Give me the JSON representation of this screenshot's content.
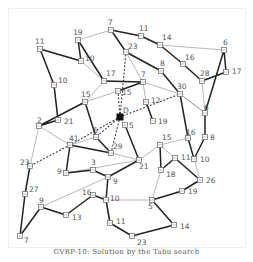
{
  "caption": "GVRP-10: Solution by the Tabu search",
  "depot": {
    "label": "D",
    "x": 120,
    "y": 117
  },
  "nodes": [
    {
      "id": "n1",
      "label": "7",
      "x": 111,
      "y": 30
    },
    {
      "id": "n2",
      "label": "11",
      "x": 141,
      "y": 36
    },
    {
      "id": "n3",
      "label": "14",
      "x": 160,
      "y": 45
    },
    {
      "id": "n4",
      "label": "6",
      "x": 224,
      "y": 50
    },
    {
      "id": "n5",
      "label": "17",
      "x": 226,
      "y": 72
    },
    {
      "id": "n6",
      "label": "19",
      "x": 78,
      "y": 40
    },
    {
      "id": "n7",
      "label": "11",
      "x": 40,
      "y": 49
    },
    {
      "id": "n8",
      "label": "10",
      "x": 81,
      "y": 61
    },
    {
      "id": "n9",
      "label": "23",
      "x": 126,
      "y": 52
    },
    {
      "id": "n10",
      "label": "16",
      "x": 183,
      "y": 64
    },
    {
      "id": "n11",
      "label": "8",
      "x": 161,
      "y": 71
    },
    {
      "id": "n12",
      "label": "28",
      "x": 202,
      "y": 81
    },
    {
      "id": "n13",
      "label": "17",
      "x": 104,
      "y": 81
    },
    {
      "id": "n14",
      "label": "7",
      "x": 143,
      "y": 82
    },
    {
      "id": "n15",
      "label": "10",
      "x": 54,
      "y": 85
    },
    {
      "id": "n16",
      "label": "15",
      "x": 118,
      "y": 91
    },
    {
      "id": "n17",
      "label": "30",
      "x": 180,
      "y": 94
    },
    {
      "id": "n18",
      "label": "15",
      "x": 85,
      "y": 102
    },
    {
      "id": "n19",
      "label": "12",
      "x": 146,
      "y": 102
    },
    {
      "id": "n20",
      "label": "6",
      "x": 205,
      "y": 113
    },
    {
      "id": "n21",
      "label": "5",
      "x": 125,
      "y": 125
    },
    {
      "id": "n22",
      "label": "19",
      "x": 153,
      "y": 121
    },
    {
      "id": "n23",
      "label": "21",
      "x": 58,
      "y": 120
    },
    {
      "id": "n24",
      "label": "2",
      "x": 39,
      "y": 126
    },
    {
      "id": "n25",
      "label": "15",
      "x": 160,
      "y": 145
    },
    {
      "id": "n26",
      "label": "8",
      "x": 205,
      "y": 137
    },
    {
      "id": "n27",
      "label": "16",
      "x": 188,
      "y": 138
    },
    {
      "id": "n28",
      "label": "41",
      "x": 70,
      "y": 145
    },
    {
      "id": "n29",
      "label": "5",
      "x": 96,
      "y": 137
    },
    {
      "id": "n30",
      "label": "29",
      "x": 111,
      "y": 153
    },
    {
      "id": "n31",
      "label": "11",
      "x": 175,
      "y": 158
    },
    {
      "id": "n32",
      "label": "10",
      "x": 194,
      "y": 159
    },
    {
      "id": "n33",
      "label": "21",
      "x": 139,
      "y": 160
    },
    {
      "id": "n34",
      "label": "23",
      "x": 30,
      "y": 166
    },
    {
      "id": "n35",
      "label": "18",
      "x": 161,
      "y": 170
    },
    {
      "id": "n36",
      "label": "26",
      "x": 200,
      "y": 180
    },
    {
      "id": "n37",
      "label": "9",
      "x": 66,
      "y": 173
    },
    {
      "id": "n38",
      "label": "3",
      "x": 93,
      "y": 170
    },
    {
      "id": "n39",
      "label": "9",
      "x": 108,
      "y": 177
    },
    {
      "id": "n40",
      "label": "19",
      "x": 182,
      "y": 191
    },
    {
      "id": "n41",
      "label": "27",
      "x": 25,
      "y": 194
    },
    {
      "id": "n42",
      "label": "16",
      "x": 93,
      "y": 195
    },
    {
      "id": "n43",
      "label": "10",
      "x": 106,
      "y": 200
    },
    {
      "id": "n44",
      "label": "5",
      "x": 152,
      "y": 200
    },
    {
      "id": "n45",
      "label": "9",
      "x": 41,
      "y": 207
    },
    {
      "id": "n46",
      "label": "13",
      "x": 66,
      "y": 215
    },
    {
      "id": "n47",
      "label": "11",
      "x": 110,
      "y": 223
    },
    {
      "id": "n48",
      "label": "14",
      "x": 174,
      "y": 225
    },
    {
      "id": "n49",
      "label": "7",
      "x": 20,
      "y": 236
    },
    {
      "id": "n50",
      "label": "23",
      "x": 132,
      "y": 236
    }
  ],
  "label_offsets": {
    "n1": [
      -3,
      -5
    ],
    "n2": [
      -2,
      -5
    ],
    "n3": [
      2,
      -5
    ],
    "n4": [
      -1,
      -5
    ],
    "n5": [
      6,
      2
    ],
    "n6": [
      -5,
      -5
    ],
    "n7": [
      -5,
      -5
    ],
    "n8": [
      4,
      0
    ],
    "n9": [
      2,
      -3
    ],
    "n10": [
      2,
      -4
    ],
    "n11": [
      -1,
      -5
    ],
    "n12": [
      -2,
      -5
    ],
    "n13": [
      2,
      -5
    ],
    "n14": [
      -2,
      -5
    ],
    "n15": [
      4,
      -2
    ],
    "n16": [
      4,
      4
    ],
    "n17": [
      -3,
      -5
    ],
    "n18": [
      -4,
      -5
    ],
    "n19": [
      5,
      1
    ],
    "n20": [
      -1,
      -3
    ],
    "n21": [
      4,
      3
    ],
    "n22": [
      5,
      3
    ],
    "n23": [
      6,
      4
    ],
    "n24": [
      -2,
      -3
    ],
    "n25": [
      2,
      -5
    ],
    "n26": [
      5,
      3
    ],
    "n27": [
      -2,
      -3
    ],
    "n28": [
      -1,
      -4
    ],
    "n29": [
      -3,
      -4
    ],
    "n30": [
      2,
      -4
    ],
    "n31": [
      6,
      2
    ],
    "n32": [
      6,
      3
    ],
    "n33": [
      0,
      9
    ],
    "n34": [
      -10,
      -1
    ],
    "n35": [
      5,
      7
    ],
    "n36": [
      6,
      3
    ],
    "n37": [
      -9,
      1
    ],
    "n38": [
      -2,
      -5
    ],
    "n39": [
      5,
      7
    ],
    "n40": [
      6,
      3
    ],
    "n41": [
      4,
      -2
    ],
    "n42": [
      -11,
      0
    ],
    "n43": [
      4,
      1
    ],
    "n44": [
      -4,
      9
    ],
    "n45": [
      -2,
      -4
    ],
    "n46": [
      6,
      5
    ],
    "n47": [
      6,
      1
    ],
    "n48": [
      6,
      4
    ],
    "n49": [
      4,
      7
    ],
    "n50": [
      5,
      9
    ]
  },
  "routes_bold": [
    [
      "n1",
      "n2",
      "n3",
      "n10",
      "n12",
      "n5",
      "n4",
      "n20",
      "n26",
      "n32",
      "n27",
      "n17",
      "n11",
      "n9",
      "n1"
    ],
    [
      "n6",
      "n8",
      "n7",
      "n15",
      "n23",
      "n24",
      "n18",
      "n29",
      "n30",
      "n28",
      "n37",
      "n38",
      "n39",
      "n43",
      "n42",
      "n46",
      "n45",
      "n49",
      "n41",
      "n34"
    ],
    [
      "n13",
      "n6"
    ],
    [
      "n13",
      "n14",
      "n16"
    ],
    [
      "n19",
      "n22"
    ],
    [
      "n21",
      "n33",
      "n39"
    ],
    [
      "n43",
      "n47",
      "n50",
      "n48",
      "n44",
      "n40",
      "n36",
      "n31",
      "n35",
      "n25"
    ]
  ],
  "routes_thin": [
    [
      "n6",
      "n1",
      "n9",
      "n14",
      "n17",
      "n20",
      "n12"
    ],
    [
      "n3",
      "n4"
    ],
    [
      "n7",
      "n8"
    ],
    [
      "n8",
      "n13",
      "n18",
      "n16"
    ],
    [
      "n15",
      "n23"
    ],
    [
      "n24",
      "n28"
    ],
    [
      "n24",
      "n34"
    ],
    [
      "n14",
      "n19"
    ],
    [
      "n17",
      "n20"
    ],
    [
      "n33",
      "n25",
      "n27"
    ],
    [
      "n28",
      "n29"
    ],
    [
      "n33",
      "n30"
    ],
    [
      "n33",
      "n37"
    ],
    [
      "n39",
      "n45"
    ],
    [
      "n43",
      "n44",
      "n35"
    ],
    [
      "n32",
      "n36"
    ],
    [
      "n45",
      "n46"
    ],
    [
      "n47",
      "n43"
    ],
    [
      "n31",
      "n25"
    ]
  ],
  "routes_dotted": [
    [
      "depot",
      "n16"
    ],
    [
      "depot",
      "n9"
    ],
    [
      "depot",
      "n17"
    ],
    [
      "depot",
      "n29"
    ],
    [
      "depot",
      "n28"
    ],
    [
      "depot",
      "n30"
    ],
    [
      "n28",
      "n34"
    ]
  ],
  "colors": {
    "bold_edge": "#222222",
    "thin_edge": "#8a8a8a",
    "dotted_edge": "#333333",
    "node_stroke": "#666666",
    "depot_fill": "#111111",
    "label": "#555555"
  }
}
